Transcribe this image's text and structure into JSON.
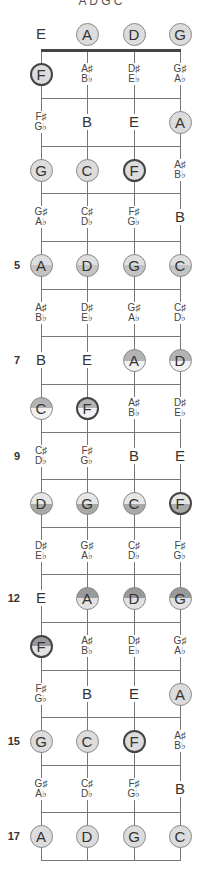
{
  "diagram": {
    "title": "A D G C",
    "strings_x": [
      41,
      87,
      134,
      180
    ],
    "nut_y": 50,
    "fret_lines_y": [
      98,
      146,
      193,
      241,
      289,
      336,
      384,
      432,
      479,
      527,
      574,
      622,
      670,
      717,
      765,
      812,
      860
    ],
    "row_y": [
      34,
      74,
      122,
      170,
      217,
      265,
      313,
      360,
      408,
      456,
      503,
      551,
      598,
      646,
      694,
      741,
      789,
      836
    ],
    "colors": {
      "line": "#777777",
      "nut": "#444444",
      "circle_fill": "#dcdcdc",
      "circle_border": "#888888",
      "bold_border": "#444444",
      "text": "#333333"
    },
    "rows": [
      {
        "fret": "",
        "cells": [
          {
            "type": "text",
            "n": "E"
          },
          {
            "type": "circle",
            "style": "c-plain",
            "n": "A"
          },
          {
            "type": "circle",
            "style": "c-plain",
            "n": "D"
          },
          {
            "type": "circle",
            "style": "c-plain",
            "n": "G"
          }
        ]
      },
      {
        "fret": "",
        "cells": [
          {
            "type": "circle",
            "style": "c-plain c-bold",
            "n": "F"
          },
          {
            "type": "acc",
            "s": "A♯",
            "f": "B♭"
          },
          {
            "type": "acc",
            "s": "D♯",
            "f": "E♭"
          },
          {
            "type": "acc",
            "s": "G♯",
            "f": "A♭"
          }
        ]
      },
      {
        "fret": "",
        "cells": [
          {
            "type": "acc",
            "s": "F♯",
            "f": "G♭"
          },
          {
            "type": "text",
            "n": "B"
          },
          {
            "type": "text",
            "n": "E"
          },
          {
            "type": "circle",
            "style": "c-plain",
            "n": "A"
          }
        ]
      },
      {
        "fret": "",
        "cells": [
          {
            "type": "circle",
            "style": "c-plain",
            "n": "G"
          },
          {
            "type": "circle",
            "style": "c-plain",
            "n": "C"
          },
          {
            "type": "circle",
            "style": "c-plain c-bold",
            "n": "F"
          },
          {
            "type": "acc",
            "s": "A♯",
            "f": "B♭"
          }
        ]
      },
      {
        "fret": "",
        "cells": [
          {
            "type": "acc",
            "s": "G♯",
            "f": "A♭"
          },
          {
            "type": "acc",
            "s": "C♯",
            "f": "D♭"
          },
          {
            "type": "acc",
            "s": "F♯",
            "f": "G♭"
          },
          {
            "type": "text",
            "n": "B"
          }
        ]
      },
      {
        "fret": "5",
        "cells": [
          {
            "type": "circle",
            "style": "c-split-bottom-soft",
            "n": "A"
          },
          {
            "type": "circle",
            "style": "c-split-bottom-soft",
            "n": "D"
          },
          {
            "type": "circle",
            "style": "c-split-bottom-soft",
            "n": "G"
          },
          {
            "type": "circle",
            "style": "c-split-bottom-soft",
            "n": "C"
          }
        ]
      },
      {
        "fret": "",
        "cells": [
          {
            "type": "acc",
            "s": "A♯",
            "f": "B♭"
          },
          {
            "type": "acc",
            "s": "D♯",
            "f": "E♭"
          },
          {
            "type": "acc",
            "s": "G♯",
            "f": "A♭"
          },
          {
            "type": "acc",
            "s": "C♯",
            "f": "D♭"
          }
        ]
      },
      {
        "fret": "7",
        "cells": [
          {
            "type": "text",
            "n": "B"
          },
          {
            "type": "text",
            "n": "E"
          },
          {
            "type": "circle",
            "style": "c-split-top",
            "n": "A"
          },
          {
            "type": "circle",
            "style": "c-split-top",
            "n": "D"
          }
        ]
      },
      {
        "fret": "",
        "cells": [
          {
            "type": "circle",
            "style": "c-split-top",
            "n": "C"
          },
          {
            "type": "circle",
            "style": "c-split-top c-bold",
            "n": "F"
          },
          {
            "type": "acc",
            "s": "A♯",
            "f": "B♭"
          },
          {
            "type": "acc",
            "s": "D♯",
            "f": "E♭"
          }
        ]
      },
      {
        "fret": "9",
        "cells": [
          {
            "type": "acc",
            "s": "C♯",
            "f": "D♭"
          },
          {
            "type": "acc",
            "s": "F♯",
            "f": "G♭"
          },
          {
            "type": "text",
            "n": "B"
          },
          {
            "type": "text",
            "n": "E"
          }
        ]
      },
      {
        "fret": "",
        "cells": [
          {
            "type": "circle",
            "style": "c-split-bottom",
            "n": "D"
          },
          {
            "type": "circle",
            "style": "c-split-bottom",
            "n": "G"
          },
          {
            "type": "circle",
            "style": "c-split-bottom",
            "n": "C"
          },
          {
            "type": "circle",
            "style": "c-split-bottom c-bold",
            "n": "F"
          }
        ]
      },
      {
        "fret": "",
        "cells": [
          {
            "type": "acc",
            "s": "D♯",
            "f": "E♭"
          },
          {
            "type": "acc",
            "s": "G♯",
            "f": "A♭"
          },
          {
            "type": "acc",
            "s": "C♯",
            "f": "D♭"
          },
          {
            "type": "acc",
            "s": "F♯",
            "f": "G♭"
          }
        ]
      },
      {
        "fret": "12",
        "cells": [
          {
            "type": "text",
            "n": "E"
          },
          {
            "type": "circle",
            "style": "c-split-top-dark",
            "n": "A"
          },
          {
            "type": "circle",
            "style": "c-split-top-dark",
            "n": "D"
          },
          {
            "type": "circle",
            "style": "c-split-top-dark",
            "n": "G"
          }
        ]
      },
      {
        "fret": "",
        "cells": [
          {
            "type": "circle",
            "style": "c-split-top-dark c-bold",
            "n": "F"
          },
          {
            "type": "acc",
            "s": "A♯",
            "f": "B♭"
          },
          {
            "type": "acc",
            "s": "D♯",
            "f": "E♭"
          },
          {
            "type": "acc",
            "s": "G♯",
            "f": "A♭"
          }
        ]
      },
      {
        "fret": "",
        "cells": [
          {
            "type": "acc",
            "s": "F♯",
            "f": "G♭"
          },
          {
            "type": "text",
            "n": "B"
          },
          {
            "type": "text",
            "n": "E"
          },
          {
            "type": "circle",
            "style": "c-plain",
            "n": "A"
          }
        ]
      },
      {
        "fret": "15",
        "cells": [
          {
            "type": "circle",
            "style": "c-plain",
            "n": "G"
          },
          {
            "type": "circle",
            "style": "c-plain",
            "n": "C"
          },
          {
            "type": "circle",
            "style": "c-plain c-bold",
            "n": "F"
          },
          {
            "type": "acc",
            "s": "A♯",
            "f": "B♭"
          }
        ]
      },
      {
        "fret": "",
        "cells": [
          {
            "type": "acc",
            "s": "G♯",
            "f": "A♭"
          },
          {
            "type": "acc",
            "s": "C♯",
            "f": "D♭"
          },
          {
            "type": "acc",
            "s": "F♯",
            "f": "G♭"
          },
          {
            "type": "text",
            "n": "B"
          }
        ]
      },
      {
        "fret": "17",
        "cells": [
          {
            "type": "circle",
            "style": "c-plain",
            "n": "A"
          },
          {
            "type": "circle",
            "style": "c-plain",
            "n": "D"
          },
          {
            "type": "circle",
            "style": "c-plain",
            "n": "G"
          },
          {
            "type": "circle",
            "style": "c-plain",
            "n": "C"
          }
        ]
      }
    ]
  }
}
